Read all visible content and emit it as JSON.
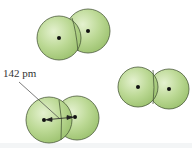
{
  "diagram": {
    "bond_length_label": "142 pm",
    "colors": {
      "sphere_fill": "#b5d68c",
      "sphere_highlight": "#e2f0cd",
      "sphere_stroke": "#4a5a3a",
      "nucleus": "#111111",
      "leader_line": "#444444"
    },
    "molecules": [
      {
        "name": "top",
        "atoms": [
          {
            "cx": 59,
            "cy": 38,
            "r": 22
          },
          {
            "cx": 88,
            "cy": 31,
            "r": 22
          }
        ]
      },
      {
        "name": "right",
        "atoms": [
          {
            "cx": 138,
            "cy": 87,
            "r": 20
          },
          {
            "cx": 169,
            "cy": 89,
            "r": 20
          }
        ]
      },
      {
        "name": "bottom-left",
        "atoms": [
          {
            "cx": 49,
            "cy": 120,
            "r": 23
          },
          {
            "cx": 77,
            "cy": 118,
            "r": 22
          }
        ]
      }
    ]
  }
}
